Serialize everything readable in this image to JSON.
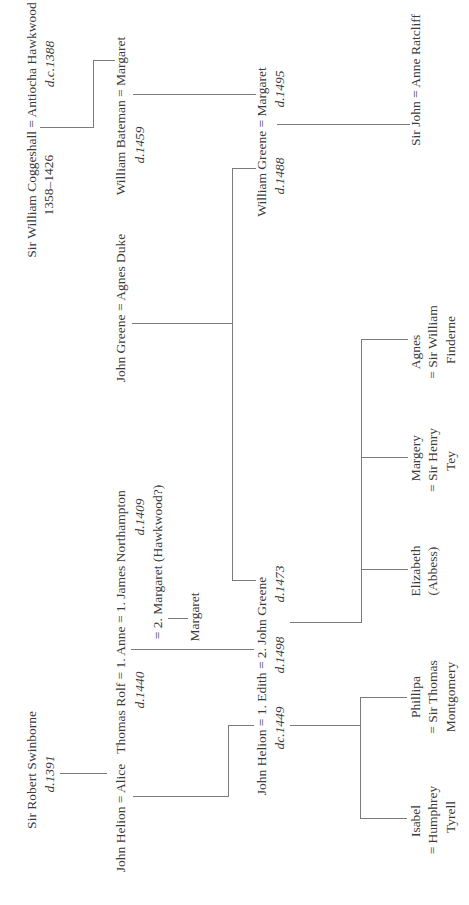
{
  "diagram": {
    "type": "family-tree",
    "orientation": "rotated-90-ccw",
    "people": {
      "coggeshall": {
        "text": "Sir William Coggeshall = Antiocha Hawkwood",
        "dates_left": "1358–1426",
        "dates_right": "d.c.1388"
      },
      "bateman": {
        "text": "William Bateman = Margaret",
        "dates": "d.1459"
      },
      "wgreene": {
        "text": "William Greene = Margaret",
        "dates_left": "d.1488",
        "dates_right": "d.1495"
      },
      "ratcliff": {
        "text": "Sir John = Anne Ratcliff"
      },
      "jgreene_duke": {
        "text": "John Greene = Agnes Duke"
      },
      "rolf": {
        "text": "Thomas Rolf  = 1. Anne = 1. James Northampton",
        "dates_left": "d.1440",
        "dates_right": "d.1409"
      },
      "margaret2": {
        "text": "= 2. Margaret (Hawkwood?)"
      },
      "margaret_child": {
        "text": "Margaret"
      },
      "swinborne": {
        "text": "Sir Robert Swinborne",
        "dates": "d.1391"
      },
      "helion_alice": {
        "text": "John Helion = Alice"
      },
      "helion_edith": {
        "text": "John Helion = 1. Edith = 2. John Greene",
        "dates_left": "dc.1449",
        "dates_mid": "d.1498",
        "dates_right": "d.1473"
      },
      "isabel": {
        "line1": "Isabel",
        "line2": "= Humphrey",
        "line3": "Tyrell"
      },
      "phillipa": {
        "line1": "Phillipa",
        "line2": "= Sir Thomas",
        "line3": "Montgomery"
      },
      "elizabeth": {
        "line1": "Elizabeth",
        "line2": "(Abbess)"
      },
      "margery": {
        "line1": "Margery",
        "line2": "= Sir Henry",
        "line3": "Tey"
      },
      "agnes": {
        "line1": "Agnes",
        "line2": "= Sir William",
        "line3": "Finderne"
      }
    },
    "line_color": "#7a7a7a",
    "text_color": "#3a3a3a"
  }
}
